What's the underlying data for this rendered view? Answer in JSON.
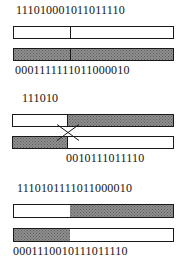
{
  "figure": {
    "type": "genetic-algorithm-crossover-diagram",
    "colors": {
      "ink": "#141414",
      "outline": "#1a1a1a",
      "shaded_fill": "#8f8f8f",
      "white_fill": "#ffffff",
      "background": "#ffffff"
    }
  },
  "parents": {
    "parent_a": {
      "string": "111010001011011110",
      "bar": {
        "segments": [
          {
            "fill": "white",
            "width_pct": 35
          },
          {
            "fill": "white",
            "width_pct": 65,
            "divider": true
          }
        ]
      }
    },
    "parent_b": {
      "string": "0001111111011000010",
      "bar": {
        "segments": [
          {
            "fill": "shaded",
            "width_pct": 35
          },
          {
            "fill": "shaded",
            "width_pct": 65,
            "divider": true
          }
        ]
      }
    }
  },
  "crossover": {
    "top_label": "111010",
    "bottom_label": "0010111011110",
    "top_left_bar": {
      "fill": "white"
    },
    "top_right_bar": {
      "fill": "shaded"
    },
    "bottom_left_bar": {
      "fill": "shaded"
    },
    "bottom_right_bar": {
      "fill": "white"
    },
    "crossing_lines": "x-crossover"
  },
  "offspring": {
    "child_a": {
      "string": "1110101111011000010",
      "bar": {
        "segments": [
          {
            "fill": "white",
            "width_pct": 35
          },
          {
            "fill": "shaded",
            "width_pct": 65
          }
        ]
      }
    },
    "child_b": {
      "string": "0001110010111011110",
      "bar": {
        "segments": [
          {
            "fill": "shaded",
            "width_pct": 35
          },
          {
            "fill": "white",
            "width_pct": 65
          }
        ]
      }
    }
  }
}
